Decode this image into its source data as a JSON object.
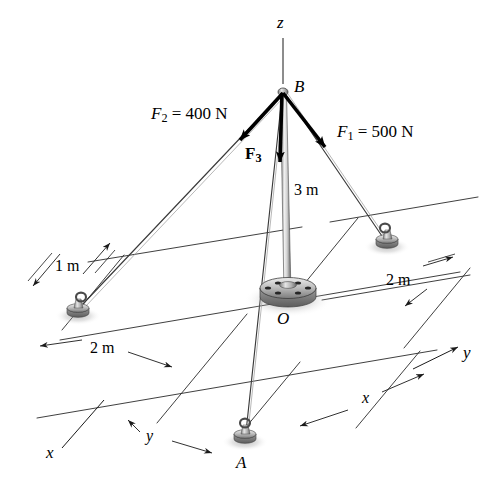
{
  "figure": {
    "type": "statics-free-body-diagram",
    "background_color": "#ffffff",
    "line_color": "#1a1a1a",
    "metal_light": "#f2f2f2",
    "metal_mid": "#a8a8a8",
    "metal_dark": "#5a5a5a",
    "arrow_color": "#000000"
  },
  "axes": [
    {
      "id": "z",
      "label": "z",
      "x": 281,
      "y": 21
    },
    {
      "id": "y",
      "label": "y",
      "x": 466,
      "y": 352
    },
    {
      "id": "x",
      "label": "x",
      "x": 49,
      "y": 452
    }
  ],
  "points": [
    {
      "id": "B",
      "label": "B",
      "x": 298,
      "y": 86,
      "px": 283,
      "py": 92
    },
    {
      "id": "O",
      "label": "O",
      "x": 281,
      "y": 318,
      "px": 288,
      "py": 299
    },
    {
      "id": "A",
      "label": "A",
      "x": 239,
      "y": 462,
      "px": 245,
      "py": 437
    }
  ],
  "forces": [
    {
      "id": "F1",
      "symbol": "F",
      "subscript": "1",
      "magnitude": "500",
      "unit": "N",
      "label": "F1 = 500 N",
      "label_x": 340,
      "label_y": 131,
      "from": [
        283,
        92
      ],
      "to": [
        330,
        152
      ]
    },
    {
      "id": "F2",
      "symbol": "F",
      "subscript": "2",
      "magnitude": "400",
      "unit": "N",
      "label": "F2 = 400 N",
      "label_x": 154,
      "label_y": 113,
      "from": [
        283,
        92
      ],
      "to": [
        236,
        144
      ]
    },
    {
      "id": "F3",
      "symbol": "F",
      "subscript": "3",
      "magnitude": "",
      "unit": "",
      "label": "F3",
      "label_x": 247,
      "label_y": 152,
      "from": [
        283,
        92
      ],
      "to": [
        280,
        168
      ]
    }
  ],
  "dimensions": [
    {
      "id": "pole-height",
      "label": "3 m",
      "x": 296,
      "y": 190,
      "describes": "height of pole OB"
    },
    {
      "id": "left-1m",
      "label": "1 m",
      "x": 58,
      "y": 266,
      "describes": "offset of left anchor"
    },
    {
      "id": "left-2m",
      "label": "2 m",
      "x": 95,
      "y": 348,
      "describes": "left anchor distance"
    },
    {
      "id": "right-2m",
      "label": "2 m",
      "x": 390,
      "y": 280,
      "describes": "right anchor distance"
    },
    {
      "id": "bottom-y",
      "label": "y",
      "x": 148,
      "y": 437,
      "describes": "y coordinate direction",
      "italic": true
    },
    {
      "id": "bottom-x",
      "label": "x",
      "x": 364,
      "y": 399,
      "describes": "x coordinate direction",
      "italic": true
    }
  ],
  "anchors": [
    {
      "id": "anchor-left",
      "x": 78,
      "y": 312,
      "connects_to": "B",
      "force": "F2"
    },
    {
      "id": "anchor-right",
      "x": 387,
      "y": 243,
      "connects_to": "B",
      "force": "F1"
    },
    {
      "id": "anchor-A",
      "x": 245,
      "y": 438,
      "connects_to": "B",
      "force": "F3"
    }
  ],
  "pole": {
    "top": [
      283,
      92
    ],
    "base": [
      288,
      297
    ],
    "base_label": "O",
    "height_label": "3 m"
  }
}
